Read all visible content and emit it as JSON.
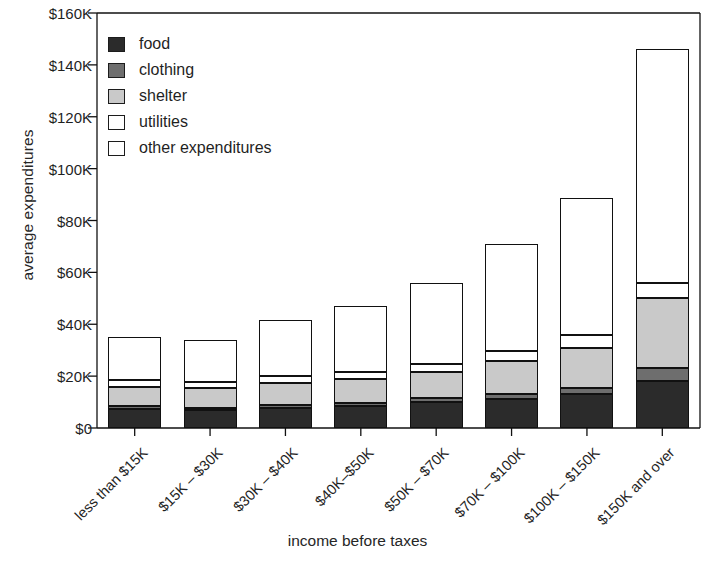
{
  "chart_data": {
    "type": "bar",
    "subtype": "stacked-bar",
    "title": "",
    "xlabel": "income before taxes",
    "ylabel": "average expenditures",
    "ylim": [
      0,
      160
    ],
    "y_unit": "thousand dollars",
    "ytick_labels": [
      "$0",
      "$20K",
      "$40K",
      "$60K",
      "$80K",
      "$100K",
      "$120K",
      "$140K",
      "$160K"
    ],
    "ytick_values": [
      0,
      20,
      40,
      60,
      80,
      100,
      120,
      140,
      160
    ],
    "grid": false,
    "legend_position": "upper-left-inside",
    "categories": [
      "less than $15K",
      "$15K – $30K",
      "$30K – $40K",
      "$40K–$50K",
      "$50K – $70K",
      "$70K – $100K",
      "$100K – $150K",
      "$150K and over"
    ],
    "series": [
      {
        "name": "food",
        "color": "#2b2b2b",
        "values": [
          7.5,
          6.8,
          7.6,
          8.4,
          10.0,
          11.2,
          13.0,
          18.0
        ]
      },
      {
        "name": "clothing",
        "color": "#6e6e6e",
        "values": [
          1.0,
          1.0,
          1.2,
          1.3,
          1.6,
          1.9,
          2.4,
          5.0
        ]
      },
      {
        "name": "shelter",
        "color": "#c9c9c9",
        "values": [
          7.5,
          7.6,
          8.6,
          9.1,
          9.9,
          12.6,
          15.6,
          27.0
        ]
      },
      {
        "name": "utilities",
        "color": "#ffffff",
        "values": [
          2.5,
          2.4,
          2.6,
          2.8,
          3.3,
          3.8,
          4.8,
          6.0
        ]
      },
      {
        "name": "other expenditures",
        "color": "#ffffff",
        "values": [
          16.5,
          16.2,
          21.8,
          25.3,
          31.0,
          41.5,
          53.0,
          90.0
        ]
      }
    ],
    "totals": [
      35.0,
      34.0,
      41.8,
      46.9,
      55.8,
      71.0,
      88.8,
      146.0
    ]
  },
  "legend": {
    "items": [
      {
        "label": "food"
      },
      {
        "label": "clothing"
      },
      {
        "label": "shelter"
      },
      {
        "label": "utilities"
      },
      {
        "label": "other expenditures"
      }
    ]
  }
}
